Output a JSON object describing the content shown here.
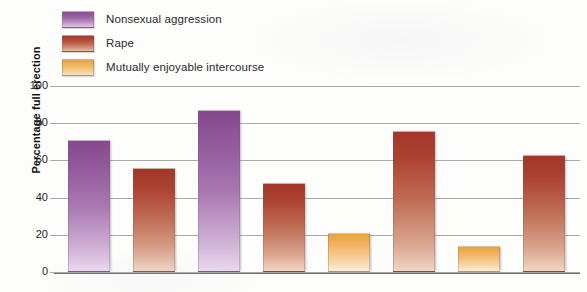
{
  "legend": {
    "items": [
      {
        "label": "Nonsexual aggression",
        "color": "#8b4f93",
        "key": "purple"
      },
      {
        "label": "Rape",
        "color": "#9e3a2c",
        "key": "red"
      },
      {
        "label": "Mutually enjoyable intercourse",
        "color": "#e6a243",
        "key": "orange"
      }
    ]
  },
  "chart_data": {
    "type": "bar",
    "title": "",
    "xlabel": "",
    "ylabel": "Percentage full erection",
    "ylim": [
      0,
      100
    ],
    "yticks": [
      0,
      20,
      40,
      60,
      80,
      100
    ],
    "ytick_labels": [
      "0",
      "20",
      "40",
      "60",
      "80",
      "100"
    ],
    "grid": true,
    "legend_position": "top-left",
    "categories": [
      "",
      "",
      "",
      "",
      "",
      "",
      "",
      ""
    ],
    "series": [
      {
        "name": "Nonsexual aggression",
        "color": "#8b4f93",
        "bars": [
          {
            "index": 0,
            "value": 70
          },
          {
            "index": 2,
            "value": 86
          }
        ]
      },
      {
        "name": "Rape",
        "color": "#9e3a2c",
        "bars": [
          {
            "index": 1,
            "value": 55
          },
          {
            "index": 3,
            "value": 47
          },
          {
            "index": 5,
            "value": 75
          },
          {
            "index": 7,
            "value": 62
          }
        ]
      },
      {
        "name": "Mutually enjoyable intercourse",
        "color": "#e6a243",
        "bars": [
          {
            "index": 4,
            "value": 20
          },
          {
            "index": 6,
            "value": 13
          }
        ]
      }
    ],
    "bars_in_order": [
      {
        "value": 70,
        "key": "purple",
        "series": "Nonsexual aggression"
      },
      {
        "value": 55,
        "key": "red",
        "series": "Rape"
      },
      {
        "value": 86,
        "key": "purple",
        "series": "Nonsexual aggression"
      },
      {
        "value": 47,
        "key": "red",
        "series": "Rape"
      },
      {
        "value": 20,
        "key": "orange",
        "series": "Mutually enjoyable intercourse"
      },
      {
        "value": 75,
        "key": "red",
        "series": "Rape"
      },
      {
        "value": 13,
        "key": "orange",
        "series": "Mutually enjoyable intercourse"
      },
      {
        "value": 62,
        "key": "red",
        "series": "Rape"
      }
    ]
  }
}
